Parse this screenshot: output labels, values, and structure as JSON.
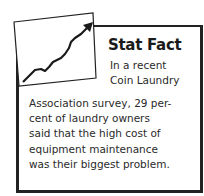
{
  "sidebar_box": {
    "icon": "rising-chart-icon",
    "title": "Stat Fact",
    "lead_lines": [
      "In a recent",
      "Coin Laundry"
    ],
    "body_lines": [
      "Association survey, 29 per-",
      "cent of laundry owners",
      "said that the high cost of",
      "equipment maintenance",
      "was their biggest problem."
    ]
  }
}
